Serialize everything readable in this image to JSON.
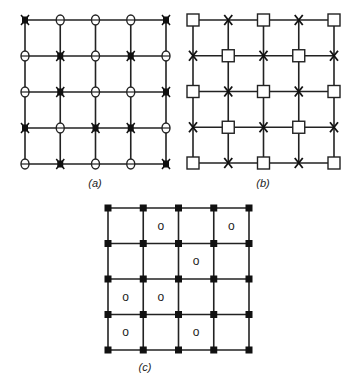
{
  "figure": {
    "panels": [
      {
        "id": "a",
        "label": "(a)",
        "origin": [
          25,
          20
        ],
        "size": [
          141,
          144
        ],
        "nodes_per_side": 5,
        "node_pattern": [
          [
            "X",
            "O",
            "O",
            "O",
            "X"
          ],
          [
            "O",
            "X",
            "O",
            "X",
            "O"
          ],
          [
            "O",
            "X",
            "O",
            "O",
            "X"
          ],
          [
            "X",
            "O",
            "X",
            "X",
            "O"
          ],
          [
            "O",
            "X",
            "O",
            "O",
            "X"
          ]
        ],
        "legend": {
          "X": "filled-cross-node",
          "O": "open-circle-node"
        }
      },
      {
        "id": "b",
        "label": "(b)",
        "origin": [
          193,
          20
        ],
        "size": [
          141,
          143
        ],
        "nodes_per_side": 5,
        "node_pattern": [
          [
            "S",
            "X",
            "S",
            "X",
            "S"
          ],
          [
            "X",
            "S",
            "X",
            "S",
            "X"
          ],
          [
            "S",
            "X",
            "S",
            "X",
            "S"
          ],
          [
            "X",
            "S",
            "X",
            "S",
            "X"
          ],
          [
            "S",
            "X",
            "S",
            "X",
            "S"
          ]
        ],
        "legend": {
          "S": "open-square-node",
          "X": "cross-node"
        }
      },
      {
        "id": "c",
        "label": "(c)",
        "origin": [
          108,
          208
        ],
        "size": [
          141,
          142
        ],
        "nodes_per_side": 5,
        "node_marker": "filled-square-node",
        "cell_marks": [
          [
            0,
            1
          ],
          [
            0,
            3
          ],
          [
            1,
            2
          ],
          [
            2,
            0
          ],
          [
            2,
            1
          ],
          [
            3,
            0
          ],
          [
            3,
            2
          ]
        ],
        "cell_mark_text": "o"
      }
    ]
  }
}
